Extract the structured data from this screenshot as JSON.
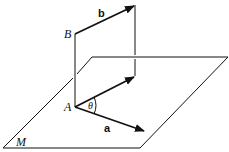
{
  "diagram": {
    "labels": {
      "B": "B",
      "A": "A",
      "M": "M",
      "a": "a",
      "b": "b",
      "theta": "θ"
    },
    "colors": {
      "stroke": "#111111",
      "background": "#ffffff"
    }
  }
}
